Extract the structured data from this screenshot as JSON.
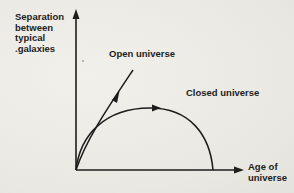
{
  "diagram": {
    "y_axis_label": "Separation\nbetween\ntypical\n.galaxies",
    "x_axis_label": "Age of\nuniverse",
    "curves": [
      {
        "name": "open",
        "label": "Open universe"
      },
      {
        "name": "closed",
        "label": "Closed universe"
      }
    ],
    "colors": {
      "ink": "#1d1d1b",
      "paper": "#ecebe6"
    }
  }
}
